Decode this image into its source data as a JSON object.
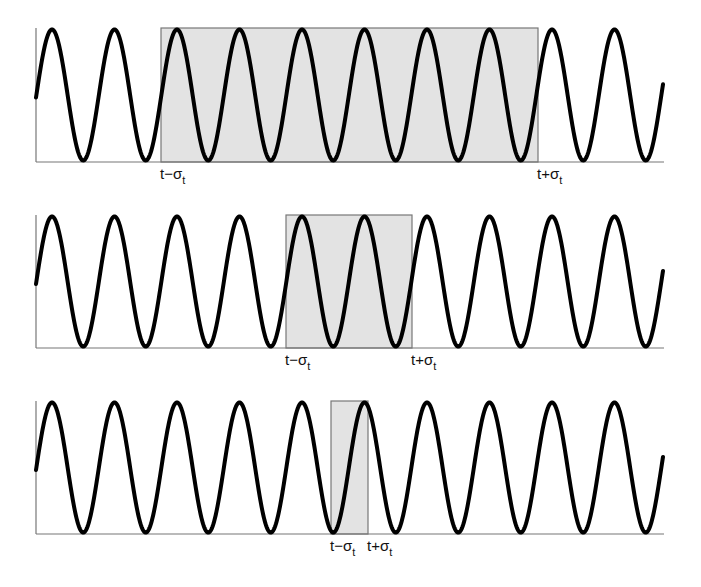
{
  "figure": {
    "colors": {
      "background": "#ffffff",
      "wave": "#000000",
      "axis": "#777777",
      "window_fill": "#e3e3e3",
      "window_stroke": "#777777"
    },
    "wave": {
      "x_start": 36,
      "x_end": 663,
      "period_px": 62.5,
      "first_peak_x": 52
    },
    "panels": [
      {
        "id": "panel-wide",
        "top": 28,
        "baseline": 162,
        "window": {
          "x1": 161,
          "x2": 538
        },
        "labels": {
          "left": {
            "main": "t−σ",
            "sub": "t"
          },
          "right": {
            "main": "t+σ",
            "sub": "t"
          }
        }
      },
      {
        "id": "panel-medium",
        "top": 215,
        "baseline": 348,
        "window": {
          "x1": 286,
          "x2": 412
        },
        "labels": {
          "left": {
            "main": "t−σ",
            "sub": "t"
          },
          "right": {
            "main": "t+σ",
            "sub": "t"
          }
        }
      },
      {
        "id": "panel-narrow",
        "top": 401,
        "baseline": 534,
        "window": {
          "x1": 331,
          "x2": 368
        },
        "labels": {
          "left": {
            "main": "t−σ",
            "sub": "t"
          },
          "right": {
            "main": "t+σ",
            "sub": "t"
          }
        }
      }
    ]
  }
}
